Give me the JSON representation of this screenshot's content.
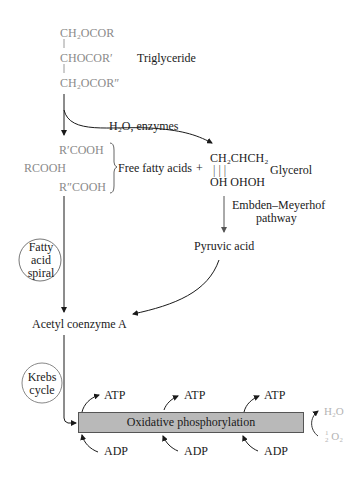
{
  "triglyceride": {
    "line1": "CH₂OCOR",
    "line2": "CHOCOR′",
    "line3": "CH₂OCOR″",
    "label": "Triglyceride"
  },
  "hydrolysis": {
    "label": "H₂O, enzymes"
  },
  "fatty_acids": {
    "r1": "R′COOH",
    "r0": "RCOOH",
    "r2": "R″COOH",
    "label": "Free fatty acids",
    "plus": "+"
  },
  "glycerol": {
    "top": "CH₂CHCH₂",
    "bonds": "|    |    |",
    "bottom": "OH OHOH",
    "label": "Glycerol"
  },
  "pathway": {
    "line1": "Embden–Meyerhof",
    "line2": "pathway"
  },
  "pyruvic": {
    "label": "Pyruvic acid"
  },
  "fatty_spiral": {
    "line1": "Fatty",
    "line2": "acid",
    "line3": "spiral"
  },
  "acetyl": {
    "label": "Acetyl coenzyme A"
  },
  "krebs": {
    "line1": "Krebs",
    "line2": "cycle"
  },
  "oxphos": {
    "label": "Oxidative phosphorylation",
    "atp": [
      "ATP",
      "ATP",
      "ATP"
    ],
    "adp": [
      "ADP",
      "ADP",
      "ADP"
    ],
    "water": "H₂O",
    "oxygen_frac_num": "1",
    "oxygen_frac_den": "2",
    "oxygen": "O₂"
  },
  "colors": {
    "bar_fill": "#b9b9b9",
    "structure_gray": "#8a8a8a",
    "light_gray": "#b4b4b4"
  }
}
